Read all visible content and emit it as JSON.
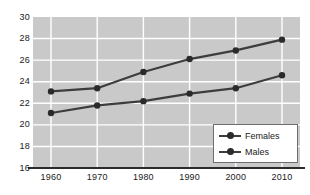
{
  "chart_data": {
    "type": "line",
    "title": "",
    "subtitle": "",
    "xlabel": "",
    "ylabel": "",
    "x": [
      1960,
      1970,
      1980,
      1990,
      2000,
      2010
    ],
    "xtick_labels": [
      "1960",
      "1970",
      "1980",
      "1990",
      "2000",
      "2010"
    ],
    "ytick_labels": [
      "30",
      "28",
      "26",
      "24",
      "22",
      "20",
      "18",
      "16"
    ],
    "yticks": [
      30,
      28,
      26,
      24,
      22,
      20,
      18,
      16
    ],
    "ylim": [
      16,
      30
    ],
    "xlim": [
      1955,
      2015
    ],
    "grid": true,
    "grid_color": "#ffffff",
    "plot_background": "#c9c9c9",
    "legend_position": "bottom-right",
    "series": [
      {
        "name": "Females",
        "color": "#3d3d3d",
        "marker": "circle",
        "values": [
          23.1,
          23.4,
          24.9,
          26.1,
          26.9,
          27.9
        ]
      },
      {
        "name": "Males",
        "color": "#3d3d3d",
        "marker": "circle",
        "values": [
          21.1,
          21.8,
          22.2,
          22.9,
          23.4,
          24.6
        ]
      }
    ]
  },
  "legend": {
    "items": [
      {
        "label": "Females",
        "icon": "line-marker-icon"
      },
      {
        "label": "Males",
        "icon": "line-marker-icon"
      }
    ]
  },
  "colors": {
    "axis": "#2b2b2b",
    "line": "#3d3d3d",
    "marker": "#2b2b2b",
    "grid": "#ffffff",
    "plot_bg": "#c9c9c9",
    "page_bg": "#ffffff",
    "text": "#1a1a1a"
  }
}
